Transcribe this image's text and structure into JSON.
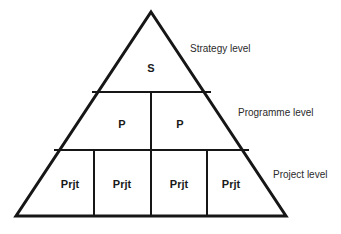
{
  "diagram": {
    "type": "hierarchy-pyramid",
    "background_color": "#ffffff",
    "line_color": "#161616",
    "text_color": "#1a1a1a",
    "apex": {
      "x": 151,
      "y": 12
    },
    "base_left": {
      "x": 16,
      "y": 216
    },
    "base_right": {
      "x": 286,
      "y": 216
    },
    "levels": [
      {
        "name": "strategy",
        "label": "Strategy level",
        "label_x": 190,
        "label_y": 48,
        "band_top_y": 12,
        "band_bottom_y": 92,
        "cells": [
          {
            "text": "S",
            "x": 151,
            "y": 68
          }
        ]
      },
      {
        "name": "programme",
        "label": "Programme level",
        "label_x": 238,
        "label_y": 112,
        "band_top_y": 92,
        "band_bottom_y": 150,
        "cells": [
          {
            "text": "P",
            "x": 122,
            "y": 124
          },
          {
            "text": "P",
            "x": 180,
            "y": 124
          }
        ]
      },
      {
        "name": "project",
        "label": "Project level",
        "label_x": 273,
        "label_y": 174,
        "band_top_y": 150,
        "band_bottom_y": 216,
        "cells": [
          {
            "text": "Prjt",
            "x": 70,
            "y": 184
          },
          {
            "text": "Prjt",
            "x": 122,
            "y": 184
          },
          {
            "text": "Prjt",
            "x": 179,
            "y": 184
          },
          {
            "text": "Prjt",
            "x": 231,
            "y": 184
          }
        ]
      }
    ],
    "dividers": {
      "horizontal": [
        {
          "name": "strategy-programme-divider",
          "x1": 92,
          "y1": 92,
          "x2": 211,
          "y2": 92
        },
        {
          "name": "programme-project-divider",
          "x1": 54,
          "y1": 150,
          "x2": 249,
          "y2": 150
        }
      ],
      "vertical": [
        {
          "name": "programme-center-divider",
          "x1": 151,
          "y1": 92,
          "x2": 151,
          "y2": 150
        },
        {
          "name": "project-divider-1",
          "x1": 94,
          "y1": 150,
          "x2": 94,
          "y2": 216
        },
        {
          "name": "project-divider-2",
          "x1": 151,
          "y1": 150,
          "x2": 151,
          "y2": 216
        },
        {
          "name": "project-divider-3",
          "x1": 207,
          "y1": 150,
          "x2": 207,
          "y2": 216
        }
      ]
    },
    "caption_fragment": ""
  }
}
